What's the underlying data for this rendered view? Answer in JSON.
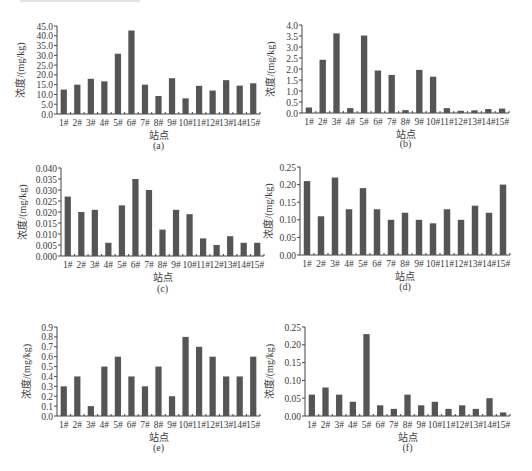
{
  "figure": {
    "x_axis_label": "站点",
    "y_axis_label": "浓度/(mg/kg)"
  },
  "chart_data": [
    {
      "id": "a",
      "type": "bar",
      "caption": "(a)",
      "title": "",
      "xlabel": "站点",
      "ylabel": "浓度/(mg/kg)",
      "categories": [
        "1#",
        "2#",
        "3#",
        "4#",
        "5#",
        "6#",
        "7#",
        "8#",
        "9#",
        "10#",
        "11#",
        "12#",
        "13#",
        "14#",
        "15#"
      ],
      "values": [
        12.5,
        15.0,
        18.0,
        16.7,
        30.8,
        42.7,
        15.0,
        9.2,
        18.3,
        8.0,
        14.4,
        12.0,
        17.3,
        14.5,
        15.7
      ],
      "ylim": [
        0,
        45
      ],
      "yticks": [
        "0.0",
        "5.0",
        "10.0",
        "15.0",
        "20.0",
        "25.0",
        "30.0",
        "35.0",
        "40.0",
        "45.0"
      ],
      "grid": false,
      "legend": "none"
    },
    {
      "id": "b",
      "type": "bar",
      "caption": "(b)",
      "title": "",
      "xlabel": "站点",
      "ylabel": "浓度/(mg/kg)",
      "categories": [
        "1#",
        "2#",
        "3#",
        "4#",
        "5#",
        "6#",
        "7#",
        "8#",
        "9#",
        "10#",
        "11#",
        "12#",
        "13#",
        "14#",
        "15#"
      ],
      "values": [
        0.25,
        2.42,
        3.62,
        0.22,
        3.52,
        1.93,
        1.73,
        0.13,
        1.96,
        1.65,
        0.22,
        0.1,
        0.12,
        0.18,
        0.2
      ],
      "ylim": [
        0,
        4.0
      ],
      "yticks": [
        "0.0",
        "0.5",
        "1.0",
        "1.5",
        "2.0",
        "2.5",
        "3.0",
        "3.5",
        "4.0"
      ],
      "grid": false,
      "legend": "none"
    },
    {
      "id": "c",
      "type": "bar",
      "caption": "(c)",
      "title": "",
      "xlabel": "站点",
      "ylabel": "浓度/(mg/kg)",
      "categories": [
        "1#",
        "2#",
        "3#",
        "4#",
        "5#",
        "6#",
        "7#",
        "8#",
        "9#",
        "10#",
        "11#",
        "12#",
        "13#",
        "14#",
        "15#"
      ],
      "values": [
        0.027,
        0.02,
        0.021,
        0.006,
        0.023,
        0.035,
        0.03,
        0.012,
        0.021,
        0.019,
        0.008,
        0.005,
        0.009,
        0.006,
        0.006
      ],
      "ylim": [
        0,
        0.04
      ],
      "yticks": [
        "0.000",
        "0.005",
        "0.010",
        "0.015",
        "0.020",
        "0.025",
        "0.030",
        "0.035",
        "0.040"
      ],
      "grid": false,
      "legend": "none"
    },
    {
      "id": "d",
      "type": "bar",
      "caption": "(d)",
      "title": "",
      "xlabel": "站点",
      "ylabel": "浓度/(mg/kg)",
      "categories": [
        "1#",
        "2#",
        "3#",
        "4#",
        "5#",
        "6#",
        "7#",
        "8#",
        "9#",
        "10#",
        "11#",
        "12#",
        "13#",
        "14#",
        "15#"
      ],
      "values": [
        0.21,
        0.11,
        0.22,
        0.13,
        0.19,
        0.13,
        0.1,
        0.12,
        0.1,
        0.09,
        0.13,
        0.1,
        0.14,
        0.12,
        0.2
      ],
      "ylim": [
        0,
        0.25
      ],
      "yticks": [
        "0.00",
        "0.05",
        "0.10",
        "0.15",
        "0.20",
        "0.25"
      ],
      "grid": false,
      "legend": "none"
    },
    {
      "id": "e",
      "type": "bar",
      "caption": "(e)",
      "title": "",
      "xlabel": "站点",
      "ylabel": "浓度/(mg/kg)",
      "categories": [
        "1#",
        "2#",
        "3#",
        "4#",
        "5#",
        "6#",
        "7#",
        "8#",
        "9#",
        "10#",
        "11#",
        "12#",
        "13#",
        "14#",
        "15#"
      ],
      "values": [
        0.3,
        0.4,
        0.1,
        0.5,
        0.6,
        0.4,
        0.3,
        0.5,
        0.2,
        0.8,
        0.7,
        0.6,
        0.4,
        0.4,
        0.6
      ],
      "ylim": [
        0,
        0.9
      ],
      "yticks": [
        "0.0",
        "0.1",
        "0.2",
        "0.3",
        "0.4",
        "0.5",
        "0.6",
        "0.7",
        "0.8",
        "0.9"
      ],
      "grid": false,
      "legend": "none"
    },
    {
      "id": "f",
      "type": "bar",
      "caption": "(f)",
      "title": "",
      "xlabel": "站点",
      "ylabel": "浓度/(mg/kg)",
      "categories": [
        "1#",
        "2#",
        "3#",
        "4#",
        "5#",
        "6#",
        "7#",
        "8#",
        "9#",
        "10#",
        "11#",
        "12#",
        "13#",
        "14#",
        "15#"
      ],
      "values": [
        0.06,
        0.08,
        0.06,
        0.04,
        0.23,
        0.03,
        0.02,
        0.06,
        0.03,
        0.04,
        0.02,
        0.03,
        0.02,
        0.05,
        0.01
      ],
      "ylim": [
        0,
        0.25
      ],
      "yticks": [
        "0.00",
        "0.05",
        "0.10",
        "0.15",
        "0.20",
        "0.25"
      ],
      "grid": false,
      "legend": "none"
    }
  ],
  "colors": {
    "bar": "#555555",
    "axis": "#444444",
    "text": "#3a3a3a"
  }
}
